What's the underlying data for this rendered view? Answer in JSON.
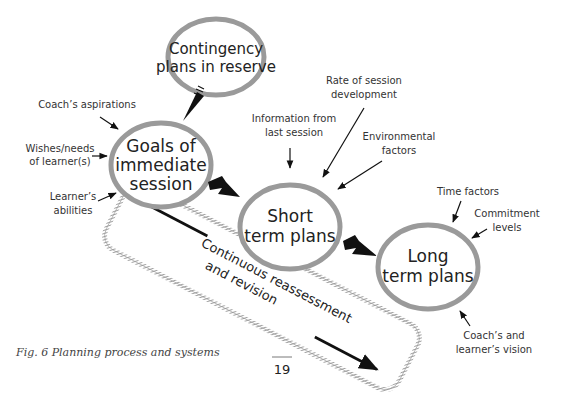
{
  "nodes": {
    "contingency": {
      "line1": "Contingency",
      "line2": "plans in reserve"
    },
    "goals": {
      "line1": "Goals of",
      "line2": "immediate",
      "line3": "session"
    },
    "short": {
      "line1": "Short",
      "line2": "term plans"
    },
    "long": {
      "line1": "Long",
      "line2": "term plans"
    }
  },
  "inputs": {
    "coach_aspirations": "Coach’s aspirations",
    "wishes_1": "Wishes/needs",
    "wishes_2": "of learner(s)",
    "abilities_1": "Learner’s",
    "abilities_2": "abilities",
    "info_1": "Information from",
    "info_2": "last session",
    "rate_1": "Rate of session",
    "rate_2": "development",
    "env_1": "Environmental",
    "env_2": "factors",
    "time": "Time factors",
    "commit_1": "Commitment",
    "commit_2": "levels",
    "vision_1": "Coach’s and",
    "vision_2": "learner’s vision"
  },
  "band": {
    "line1": "Continuous reassessment",
    "line2": "and revision"
  },
  "caption": "Fig. 6  Planning process and systems",
  "page_number": "19",
  "colors": {
    "ellipse_stroke": "#9a9a9a",
    "arrow": "#111111",
    "band_stroke": "#8a8a8a"
  }
}
